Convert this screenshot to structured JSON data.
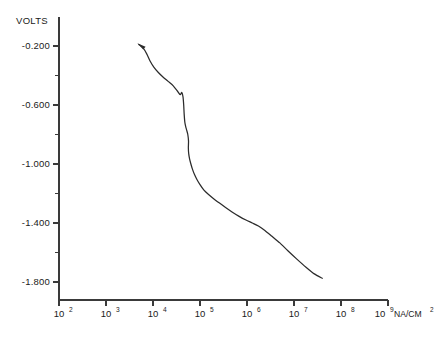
{
  "chart_data": {
    "type": "line",
    "title": "",
    "xlabel": "NA/CM2",
    "ylabel": "VOLTS",
    "xscale": "log",
    "yscale": "linear",
    "xlim": [
      100,
      1000000000
    ],
    "ylim": [
      -1.9,
      -0.1
    ],
    "grid": false,
    "legend": null,
    "x_tick_labels": [
      {
        "mantissa": "10",
        "exponent": "2",
        "value": 100
      },
      {
        "mantissa": "10",
        "exponent": "3",
        "value": 1000
      },
      {
        "mantissa": "10",
        "exponent": "4",
        "value": 10000
      },
      {
        "mantissa": "10",
        "exponent": "5",
        "value": 100000
      },
      {
        "mantissa": "10",
        "exponent": "6",
        "value": 1000000
      },
      {
        "mantissa": "10",
        "exponent": "7",
        "value": 10000000
      },
      {
        "mantissa": "10",
        "exponent": "8",
        "value": 100000000
      },
      {
        "mantissa": "10",
        "exponent": "9",
        "value": 1000000000
      }
    ],
    "x_axis_unit": {
      "text": "NA/CM",
      "exponent": "2"
    },
    "y_tick_labels": [
      "-0.200",
      "-0.600",
      "-1.000",
      "-1.400",
      "-1.800"
    ],
    "y_major_values": [
      -0.2,
      -0.6,
      -1.0,
      -1.4,
      -1.8
    ],
    "y_minor_values": [
      -0.4,
      -0.8,
      -1.2,
      -1.6
    ],
    "annotations": [
      {
        "type": "arrowhead",
        "direction": "left",
        "x": 5000,
        "y": -0.19
      }
    ],
    "series": [
      {
        "name": "polarization curve",
        "points": [
          [
            5000,
            -0.19
          ],
          [
            6200,
            -0.215
          ],
          [
            7400,
            -0.255
          ],
          [
            8600,
            -0.3
          ],
          [
            10500,
            -0.345
          ],
          [
            13000,
            -0.38
          ],
          [
            16500,
            -0.412
          ],
          [
            21000,
            -0.44
          ],
          [
            27000,
            -0.47
          ],
          [
            33000,
            -0.505
          ],
          [
            38000,
            -0.53
          ],
          [
            41000,
            -0.515
          ],
          [
            43500,
            -0.545
          ],
          [
            45000,
            -0.6
          ],
          [
            46000,
            -0.66
          ],
          [
            47500,
            -0.715
          ],
          [
            49500,
            -0.745
          ],
          [
            52000,
            -0.77
          ],
          [
            55000,
            -0.8
          ],
          [
            57000,
            -0.845
          ],
          [
            56500,
            -0.89
          ],
          [
            57500,
            -0.93
          ],
          [
            60000,
            -0.965
          ],
          [
            64000,
            -1.0
          ],
          [
            69000,
            -1.035
          ],
          [
            76000,
            -1.07
          ],
          [
            86000,
            -1.105
          ],
          [
            100000,
            -1.14
          ],
          [
            120000,
            -1.175
          ],
          [
            150000,
            -1.205
          ],
          [
            195000,
            -1.235
          ],
          [
            260000,
            -1.265
          ],
          [
            350000,
            -1.295
          ],
          [
            480000,
            -1.325
          ],
          [
            680000,
            -1.355
          ],
          [
            950000,
            -1.38
          ],
          [
            1300000,
            -1.4
          ],
          [
            1750000,
            -1.42
          ],
          [
            2400000,
            -1.45
          ],
          [
            3400000,
            -1.49
          ],
          [
            5000000,
            -1.535
          ],
          [
            7500000,
            -1.59
          ],
          [
            11500000,
            -1.645
          ],
          [
            18000000,
            -1.7
          ],
          [
            27000000,
            -1.745
          ],
          [
            40000000,
            -1.775
          ]
        ]
      }
    ]
  }
}
